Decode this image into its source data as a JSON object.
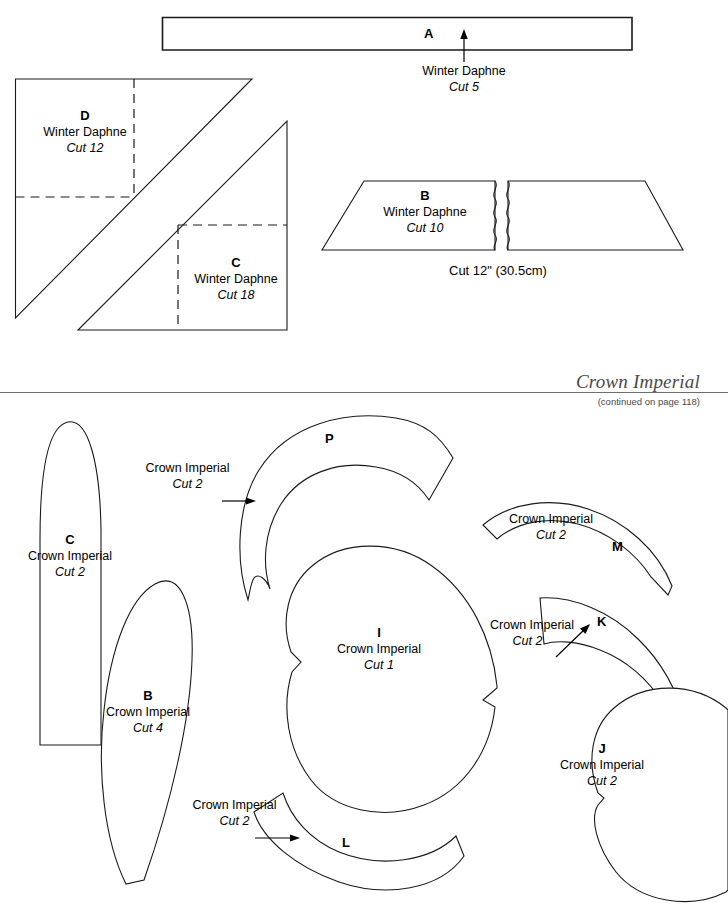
{
  "sheet": {
    "width": 728,
    "height": 905,
    "background_color": "#ffffff",
    "ink_color": "#1a1a1a"
  },
  "running_head": {
    "title": "Crown Imperial",
    "continued_note": "(continued on page 118)"
  },
  "sections": [
    {
      "id": "winter-daphne",
      "pattern_name": "Winter Daphne",
      "pieces": [
        {
          "id": "A",
          "letter": "A",
          "flower": "Winter Daphne",
          "cut": "Cut 5",
          "shape": "long-thin-rectangle",
          "label_placement": "below-with-arrow"
        },
        {
          "id": "D",
          "letter": "D",
          "flower": "Winter Daphne",
          "cut": "Cut 12",
          "shape": "right-triangle",
          "label_placement": "inside",
          "has_dashed_grid": true
        },
        {
          "id": "C",
          "letter": "C",
          "flower": "Winter Daphne",
          "cut": "Cut 18",
          "shape": "right-triangle",
          "label_placement": "inside",
          "has_dashed_grid": true
        },
        {
          "id": "B",
          "letter": "B",
          "flower": "Winter Daphne",
          "cut": "Cut 10",
          "shape": "trapezoid-with-break",
          "label_placement": "inside",
          "measurement_note": "Cut 12\" (30.5cm)"
        }
      ]
    },
    {
      "id": "crown-imperial",
      "pattern_name": "Crown Imperial",
      "pieces": [
        {
          "id": "C2",
          "letter": "C",
          "flower": "Crown Imperial",
          "cut": "Cut 2",
          "shape": "long-petal-flat-base",
          "label_placement": "inside"
        },
        {
          "id": "B2",
          "letter": "B",
          "flower": "Crown Imperial",
          "cut": "Cut 4",
          "shape": "tilted-leaf",
          "label_placement": "inside"
        },
        {
          "id": "P",
          "letter": "P",
          "flower": "Crown Imperial",
          "cut": "Cut 2",
          "shape": "thick-arc-band",
          "label_placement": "outside-with-arrow"
        },
        {
          "id": "I",
          "letter": "I",
          "flower": "Crown Imperial",
          "cut": "Cut 1",
          "shape": "heart-left-notch",
          "label_placement": "inside"
        },
        {
          "id": "M",
          "letter": "M",
          "flower": "Crown Imperial",
          "cut": "Cut 2",
          "shape": "arc-band",
          "label_placement": "inside"
        },
        {
          "id": "K",
          "letter": "K",
          "flower": "Crown Imperial",
          "cut": "Cut 2",
          "shape": "arc-band",
          "label_placement": "outside-with-arrow"
        },
        {
          "id": "J",
          "letter": "J",
          "flower": "Crown Imperial",
          "cut": "Cut 2",
          "shape": "heart-right-notch",
          "label_placement": "inside"
        },
        {
          "id": "L",
          "letter": "L",
          "flower": "Crown Imperial",
          "cut": "Cut 2",
          "shape": "crescent-band",
          "label_placement": "outside-with-arrow"
        }
      ]
    }
  ],
  "labels": {
    "A": {
      "letter": "A",
      "flower": "Winter Daphne",
      "cut": "Cut 5"
    },
    "D": {
      "letter": "D",
      "flower": "Winter Daphne",
      "cut": "Cut 12"
    },
    "C": {
      "letter": "C",
      "flower": "Winter Daphne",
      "cut": "Cut 18"
    },
    "B": {
      "letter": "B",
      "flower": "Winter Daphne",
      "cut": "Cut 10"
    },
    "B_note": "Cut 12\" (30.5cm)",
    "C2": {
      "letter": "C",
      "flower": "Crown Imperial",
      "cut": "Cut 2"
    },
    "B2": {
      "letter": "B",
      "flower": "Crown Imperial",
      "cut": "Cut 4"
    },
    "P": {
      "letter": "P",
      "flower": "Crown Imperial",
      "cut": "Cut 2"
    },
    "I": {
      "letter": "I",
      "flower": "Crown Imperial",
      "cut": "Cut 1"
    },
    "M": {
      "letter": "M",
      "flower": "Crown Imperial",
      "cut": "Cut 2"
    },
    "K": {
      "letter": "K",
      "flower": "Crown Imperial",
      "cut": "Cut 2"
    },
    "J": {
      "letter": "J",
      "flower": "Crown Imperial",
      "cut": "Cut 2"
    },
    "L": {
      "letter": "L",
      "flower": "Crown Imperial",
      "cut": "Cut 2"
    }
  }
}
